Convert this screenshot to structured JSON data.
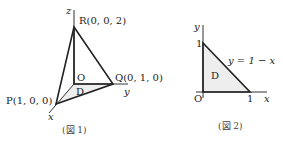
{
  "figure1": {
    "caption": "(図 1)",
    "axis_z": "z",
    "axis_y": "y",
    "axis_x": "x",
    "point_R": "R(0, 0, 2)",
    "point_Q": "Q(0, 1, 0)",
    "point_P": "P(1, 0, 0)",
    "point_O": "O",
    "region_D": "D"
  },
  "figure2": {
    "caption": "(図 2)",
    "axis_y": "y",
    "axis_x": "x",
    "tick_y1": "1",
    "tick_x1": "1",
    "origin": "O",
    "line_label": "y = 1 − x",
    "region_D": "D",
    "fill_color": "#eeeeee"
  }
}
